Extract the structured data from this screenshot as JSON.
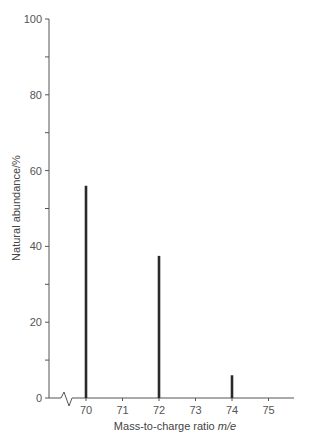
{
  "chart_data": {
    "type": "bar",
    "title": "",
    "xlabel": "Mass-to-charge ratio m/e",
    "xlabel_parts": {
      "text": "Mass-to-charge ratio ",
      "italic": "m/e"
    },
    "ylabel": "Natural abundance/%",
    "categories": [
      70,
      72,
      74
    ],
    "values": [
      56,
      37.5,
      6
    ],
    "x_ticks": [
      70,
      71,
      72,
      73,
      74,
      75
    ],
    "y_ticks": [
      0,
      20,
      40,
      60,
      80,
      100
    ],
    "ylim": [
      0,
      100
    ],
    "xlim": [
      69.3,
      75.7
    ],
    "axis_break": "x-axis break before 70",
    "grid": false,
    "legend": null,
    "bar_color": "#2a2a2a",
    "axis_color": "#555555"
  }
}
